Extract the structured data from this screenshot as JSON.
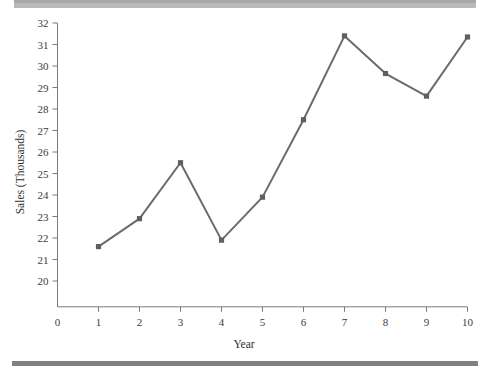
{
  "chart_data": {
    "type": "line",
    "title": "",
    "subtitle": "",
    "xlabel": "Year",
    "ylabel": "Sales (Thousands)",
    "x": [
      1,
      2,
      3,
      4,
      5,
      6,
      7,
      8,
      9,
      10
    ],
    "values": [
      21.6,
      22.9,
      25.5,
      21.9,
      23.9,
      27.5,
      31.4,
      29.65,
      28.6,
      31.35
    ],
    "series": [
      {
        "name": "Sales",
        "values": [
          21.6,
          22.9,
          25.5,
          21.9,
          23.9,
          27.5,
          31.4,
          29.65,
          28.6,
          31.35
        ]
      }
    ],
    "xticks": [
      "0",
      "1",
      "2",
      "3",
      "4",
      "5",
      "6",
      "7",
      "8",
      "9",
      "10"
    ],
    "xtick_values": [
      0,
      1,
      2,
      3,
      4,
      5,
      6,
      7,
      8,
      9,
      10
    ],
    "yticks": [
      "32",
      "31",
      "30",
      "29",
      "28",
      "27",
      "26",
      "25",
      "24",
      "23",
      "22",
      "21",
      "20"
    ],
    "ytick_values": [
      32,
      31,
      30,
      29,
      28,
      27,
      26,
      25,
      24,
      23,
      22,
      21,
      20
    ],
    "xlim": [
      0,
      10
    ],
    "ylim": [
      18.8,
      32
    ],
    "grid": false,
    "legend": false,
    "legend_position": "none",
    "marker": "square",
    "colors": {
      "line": "#6b6b6b",
      "marker": "#5f5f5f",
      "axis": "#7a7a7a",
      "text": "#3b3b3b",
      "background": "#ffffff",
      "band_top": "#b9b9b9",
      "band_bottom": "#808080"
    }
  }
}
